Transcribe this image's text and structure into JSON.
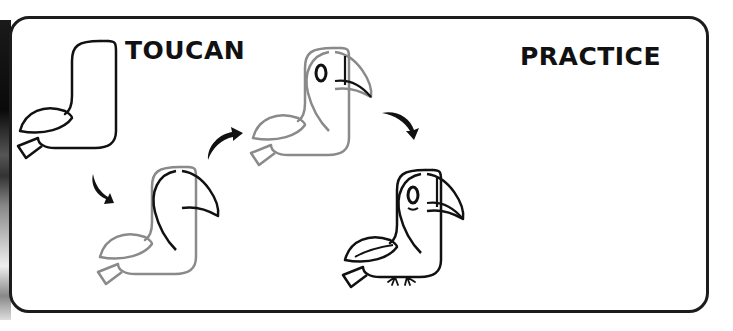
{
  "title_left": "TOUCAN",
  "title_right": "PRACTICE",
  "steps": [
    {
      "step": 1,
      "description": "body outline"
    },
    {
      "step": 2,
      "description": "add beak and face"
    },
    {
      "step": 3,
      "description": "add eye and beak stripes"
    },
    {
      "step": 4,
      "description": "finished toucan with feet"
    }
  ],
  "arrows": [
    "arrow-step1-to-step2",
    "arrow-step2-to-step3",
    "arrow-step3-to-step4"
  ],
  "colors": {
    "ink": "#111111",
    "guide": "#8a8a8a",
    "frame": "#1c1c1c"
  }
}
